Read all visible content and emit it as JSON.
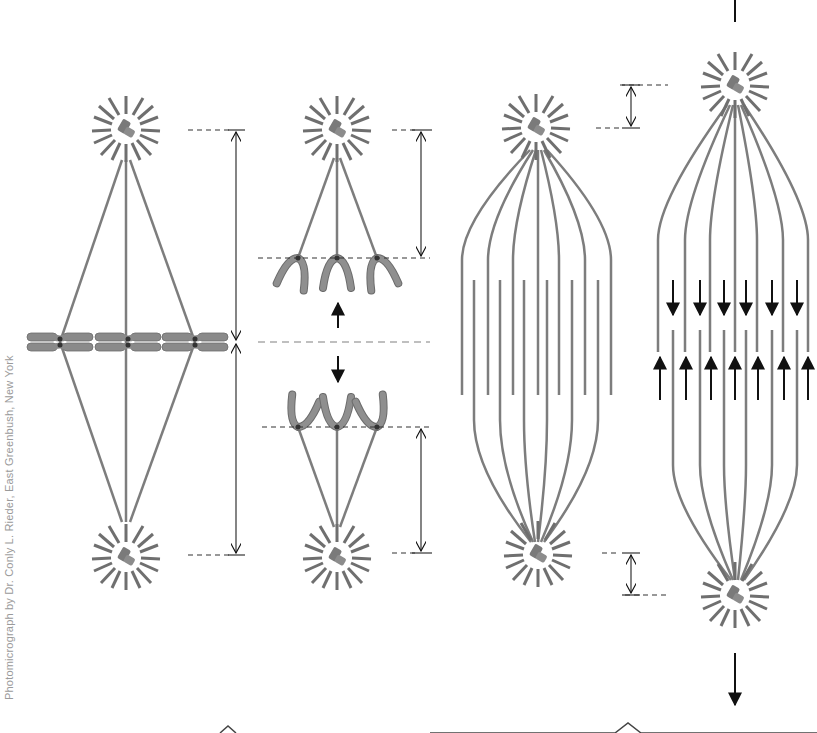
{
  "credit": "Photomicrograph by Dr. Conly L. Rieder, East Greenbush, New York",
  "colors": {
    "microtubule": "#7d7d7d",
    "aster_ray": "#6f6f6f",
    "chromosome": "#8a8a8a",
    "centrosome": "#7a7a7a",
    "arrow": "#111111",
    "dashed_guide": "#333333",
    "midline": "#aaaaaa",
    "background": "#ffffff"
  },
  "panels": [
    {
      "id": "metaphase",
      "description": "Metaphase spindle with chromosomes aligned at equator"
    },
    {
      "id": "anaphase-a",
      "description": "Anaphase A: chromosomes move to poles, kinetochore fibers shorten"
    },
    {
      "id": "anaphase-b-before",
      "description": "Anaphase B start: overlapping polar microtubules"
    },
    {
      "id": "anaphase-b-after",
      "description": "Anaphase B: polar microtubules slide apart, poles separate"
    }
  ],
  "bottom_brackets": [
    {
      "label_hidden": true,
      "span": "left"
    },
    {
      "label_hidden": true,
      "span": "right"
    }
  ]
}
